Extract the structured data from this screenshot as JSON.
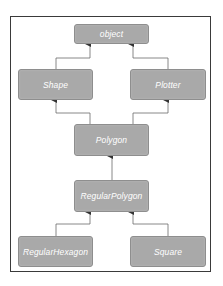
{
  "diagram": {
    "type": "class-inheritance-hierarchy",
    "colors": {
      "node_fill": "#a9a9a9",
      "node_text": "#ffffff",
      "edge": "#555555",
      "frame": "#3a3a3a"
    },
    "nodes": [
      {
        "id": "object",
        "label": "object"
      },
      {
        "id": "shape",
        "label": "Shape"
      },
      {
        "id": "plotter",
        "label": "Plotter"
      },
      {
        "id": "polygon",
        "label": "Polygon"
      },
      {
        "id": "regular_polygon",
        "label": "RegularPolygon"
      },
      {
        "id": "regular_hexagon",
        "label": "RegularHexagon"
      },
      {
        "id": "square",
        "label": "Square"
      }
    ],
    "edges": [
      {
        "from": "Shape",
        "to": "object",
        "style": "arrow-to-parent"
      },
      {
        "from": "Plotter",
        "to": "object",
        "style": "arrow-to-parent"
      },
      {
        "from": "Polygon",
        "to": "Shape",
        "style": "arrow-to-parent"
      },
      {
        "from": "Polygon",
        "to": "Plotter",
        "style": "arrow-to-parent"
      },
      {
        "from": "RegularPolygon",
        "to": "Polygon",
        "style": "arrow-to-parent"
      },
      {
        "from": "RegularHexagon",
        "to": "RegularPolygon",
        "style": "arrow-to-parent"
      },
      {
        "from": "Square",
        "to": "RegularPolygon",
        "style": "arrow-to-parent"
      }
    ]
  }
}
